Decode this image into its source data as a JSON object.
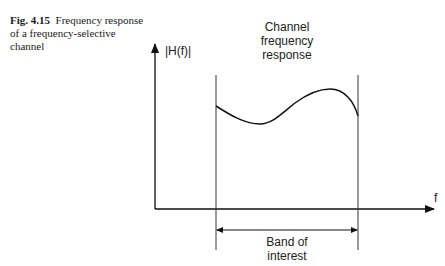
{
  "caption": {
    "fig_label": "Fig. 4.15",
    "text": "Frequency response of a frequency-selective channel"
  },
  "diagram": {
    "y_axis_label": "|H(f)|",
    "x_axis_label": "f",
    "curve_label_line1": "Channel",
    "curve_label_line2": "frequency",
    "curve_label_line3": "response",
    "band_label_line1": "Band of",
    "band_label_line2": "interest"
  }
}
